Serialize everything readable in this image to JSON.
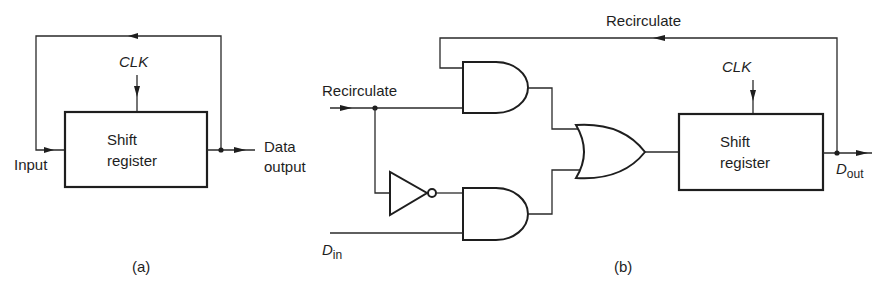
{
  "diagram_a": {
    "caption": "(a)",
    "block_label_line1": "Shift",
    "block_label_line2": "register",
    "clock_label": "CLK",
    "input_label": "Input",
    "output_label_line1": "Data",
    "output_label_line2": "output"
  },
  "diagram_b": {
    "caption": "(b)",
    "feedback_label": "Recirculate",
    "control_input_label": "Recirculate",
    "data_input_label": "D",
    "data_input_subscript": "in",
    "data_output_label": "D",
    "data_output_subscript": "out",
    "block_label_line1": "Shift",
    "block_label_line2": "register",
    "clock_label": "CLK",
    "gates": [
      "AND (upper)",
      "NOT",
      "AND (lower)",
      "OR"
    ]
  },
  "colors": {
    "ink": "#1e1e1e",
    "background": "#ffffff"
  }
}
